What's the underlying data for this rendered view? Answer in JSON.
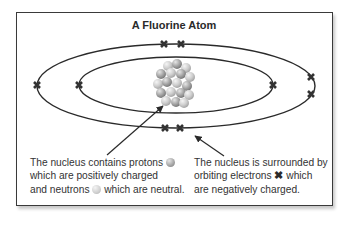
{
  "title": "A Fluorine Atom",
  "atom": {
    "element": "Fluorine",
    "shells": [
      {
        "name": "inner",
        "electrons": 2
      },
      {
        "name": "outer",
        "electrons": 7
      }
    ],
    "colors": {
      "line": "#2a2a2a",
      "electron": "#333333",
      "nucleus_light": "#e0e0e0",
      "nucleus_dark": "#8a8a8a"
    }
  },
  "captions": {
    "nucleus": {
      "line1_a": "The nucleus contains protons",
      "line2": "which are positively charged",
      "line3_a": "and neutrons",
      "line3_b": "which are neutral."
    },
    "electrons": {
      "line1": "The nucleus is surrounded by",
      "line2_a": "orbiting electrons",
      "line2_b": "which",
      "line3": "are negatively charged."
    }
  },
  "icons": {
    "electron_symbol": "✖"
  }
}
